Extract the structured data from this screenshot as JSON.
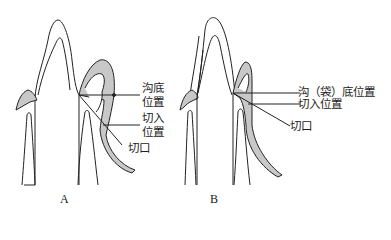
{
  "panels": [
    {
      "id": "A",
      "label": "A",
      "annotations": {
        "sulcus_bottom": [
          "沟底",
          "位置"
        ],
        "incision_position": [
          "切入",
          "位置"
        ],
        "incision": "切口"
      }
    },
    {
      "id": "B",
      "label": "B",
      "annotations": {
        "sulcus_bottom": "沟（袋）底位置",
        "incision_position": "切入位置",
        "incision": "切口"
      }
    }
  ],
  "colors": {
    "line": "#222222",
    "gingiva_fill": "#c8c8c8"
  }
}
